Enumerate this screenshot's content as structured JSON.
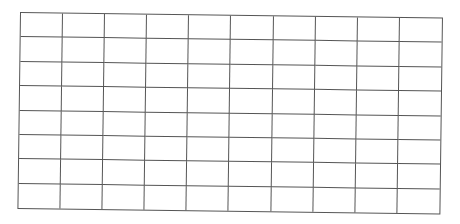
{
  "grid": {
    "rows": 8,
    "columns": 10,
    "line_color": "#555555",
    "background_color": "#ffffff"
  }
}
